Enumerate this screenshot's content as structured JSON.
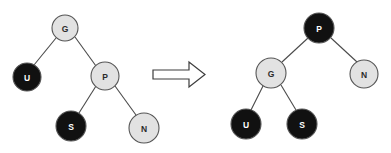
{
  "figure": {
    "background_color": "#ffffff",
    "width": 391,
    "height": 153
  },
  "colors": {
    "node_black_fill": "#111111",
    "node_gray_fill": "#e2e2e2",
    "node_stroke": "#555555",
    "edge_stroke": "#4a4a4a",
    "label_on_black": "#ffffff",
    "label_on_gray": "#2b2b2b",
    "arrow_fill": "#ffffff",
    "arrow_stroke": "#3d3d3d"
  },
  "transition_arrow": {
    "icon_name": "right-arrow-icon",
    "direction": "right",
    "x": 153,
    "y": 62,
    "width": 52,
    "height": 25,
    "shaft_height": 9,
    "head_width": 16
  },
  "left_tree": {
    "name": "before-tree",
    "root_key": "G",
    "nodes": [
      {
        "id": "left-G",
        "label": "G",
        "color": "gray",
        "cx": 65,
        "cy": 28,
        "r": 13
      },
      {
        "id": "left-U",
        "label": "U",
        "color": "black",
        "cx": 27,
        "cy": 77,
        "r": 14
      },
      {
        "id": "left-P",
        "label": "P",
        "color": "gray",
        "cx": 105,
        "cy": 76,
        "r": 14
      },
      {
        "id": "left-S",
        "label": "S",
        "color": "black",
        "cx": 71,
        "cy": 126,
        "r": 15
      },
      {
        "id": "left-N",
        "label": "N",
        "color": "gray",
        "cx": 144,
        "cy": 128,
        "r": 15
      }
    ],
    "edges": [
      {
        "id": "left-edge-G-U",
        "from": "left-G",
        "to": "left-U",
        "x1": 56,
        "y1": 38,
        "x2": 34,
        "y2": 65
      },
      {
        "id": "left-edge-G-P",
        "from": "left-G",
        "to": "left-P",
        "x1": 75,
        "y1": 37,
        "x2": 96,
        "y2": 66
      },
      {
        "id": "left-edge-P-S",
        "from": "left-P",
        "to": "left-S",
        "x1": 96,
        "y1": 86,
        "x2": 79,
        "y2": 113
      },
      {
        "id": "left-edge-P-N",
        "from": "left-P",
        "to": "left-N",
        "x1": 115,
        "y1": 86,
        "x2": 136,
        "y2": 115
      }
    ]
  },
  "right_tree": {
    "name": "after-tree",
    "root_key": "P",
    "nodes": [
      {
        "id": "right-P",
        "label": "P",
        "color": "black",
        "cx": 319,
        "cy": 28,
        "r": 15
      },
      {
        "id": "right-G",
        "label": "G",
        "color": "gray",
        "cx": 271,
        "cy": 73,
        "r": 15
      },
      {
        "id": "right-N",
        "label": "N",
        "color": "gray",
        "cx": 364,
        "cy": 74,
        "r": 14
      },
      {
        "id": "right-U",
        "label": "U",
        "color": "black",
        "cx": 246,
        "cy": 124,
        "r": 15
      },
      {
        "id": "right-S",
        "label": "S",
        "color": "black",
        "cx": 302,
        "cy": 124,
        "r": 15
      }
    ],
    "edges": [
      {
        "id": "right-edge-P-G",
        "from": "right-P",
        "to": "right-G",
        "x1": 308,
        "y1": 38,
        "x2": 282,
        "y2": 62
      },
      {
        "id": "right-edge-P-N",
        "from": "right-P",
        "to": "right-N",
        "x1": 331,
        "y1": 38,
        "x2": 357,
        "y2": 62
      },
      {
        "id": "right-edge-G-U",
        "from": "right-G",
        "to": "right-U",
        "x1": 263,
        "y1": 86,
        "x2": 251,
        "y2": 110
      },
      {
        "id": "right-edge-G-S",
        "from": "right-G",
        "to": "right-S",
        "x1": 281,
        "y1": 85,
        "x2": 296,
        "y2": 110
      }
    ]
  }
}
